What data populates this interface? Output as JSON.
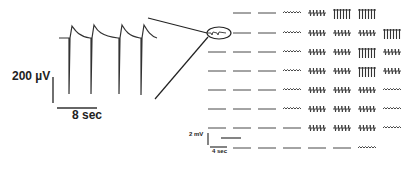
{
  "figure": {
    "left_panel": {
      "description": "Expanded extracellular recording from the circled electrode",
      "scale_bar_voltage": "200 µV",
      "scale_bar_time": "8 sec",
      "spike_count": 4
    },
    "right_panel": {
      "description": "Multi-electrode array recording grid (8 rows x 8 columns)",
      "scale_bar_voltage": "2 mV",
      "scale_bar_time": "4 sec",
      "highlighted_electrode": {
        "row": 2,
        "col": 1
      },
      "grid": [
        [
          "empty",
          "flat",
          "flat",
          "wave",
          "spiky",
          "bigspike",
          "bigspike",
          "empty"
        ],
        [
          "circled",
          "flat",
          "flat",
          "wave",
          "spiky",
          "spiky",
          "spiky",
          "bigspike"
        ],
        [
          "flat",
          "flat",
          "flat",
          "wave",
          "spiky",
          "spiky",
          "bigspike",
          "spiky"
        ],
        [
          "flat",
          "flat",
          "flat",
          "wave",
          "spiky",
          "spiky",
          "bigspike",
          "spiky"
        ],
        [
          "flat",
          "flat",
          "flat",
          "wave",
          "spiky",
          "spiky",
          "spiky",
          "wave"
        ],
        [
          "flat",
          "flat",
          "flat",
          "wave",
          "spiky",
          "spiky",
          "spiky",
          "wave"
        ],
        [
          "flat",
          "flat",
          "flat",
          "flat",
          "spiky",
          "spiky",
          "spiky",
          "wave"
        ],
        [
          "scale",
          "flat",
          "flat",
          "flat",
          "flat",
          "flat",
          "wave",
          "empty"
        ]
      ]
    }
  },
  "colors": {
    "trace": "#333333",
    "background": "#ffffff"
  }
}
